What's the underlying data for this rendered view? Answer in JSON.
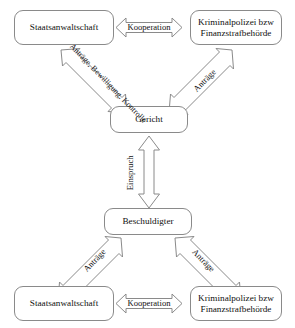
{
  "figure": {
    "type": "flow-diagram",
    "background_color": "#ffffff",
    "line_color": "#8a8a8a",
    "text_color": "#111111"
  },
  "nodes": {
    "prosecution_top": {
      "line1": "Staatsanwaltschaft"
    },
    "police_top": {
      "line1": "Kriminalpolizei bzw",
      "line2": "Finanzstrafbehörde"
    },
    "court": {
      "line1": "Gericht"
    },
    "accused": {
      "line1": "Beschuldigter"
    },
    "prosecution_bottom": {
      "line1": "Staatsanwaltschaft"
    },
    "police_bottom": {
      "line1": "Kriminalpolizei bzw",
      "line2": "Finanzstrafbehörde"
    }
  },
  "arrows": {
    "kooperation_top": {
      "label": "Kooperation",
      "heads": "both",
      "orientation": "horizontal"
    },
    "kooperation_bottom": {
      "label": "Kooperation",
      "heads": "both",
      "orientation": "horizontal"
    },
    "einspruch": {
      "label": "Einspruch",
      "heads": "both",
      "orientation": "vertical"
    },
    "prosecution_to_court": {
      "line1": "Anträge,",
      "line2": "Bewilligung,",
      "line3": "Kontrolle",
      "heads": "both",
      "orientation": "diagonal-down-right"
    },
    "police_to_court": {
      "label": "Anträge",
      "heads": "both",
      "orientation": "diagonal-down-left"
    },
    "accused_to_prosecution": {
      "label": "Anträge",
      "heads": "both",
      "orientation": "diagonal-down-left"
    },
    "accused_to_police": {
      "label": "Anträge",
      "heads": "both",
      "orientation": "diagonal-down-right"
    }
  }
}
